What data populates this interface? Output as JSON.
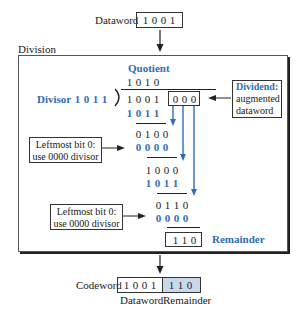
{
  "top": {
    "dataword_label": "Dataword",
    "dataword_bits": [
      "1",
      "0",
      "0",
      "1"
    ]
  },
  "division": {
    "section_label": "Division",
    "quotient_label": "Quotient",
    "quotient_bits": [
      "1",
      "0",
      "1",
      "0"
    ],
    "divisor_label": "Divisor",
    "divisor_bits": [
      "1",
      "0",
      "1",
      "1"
    ],
    "dividend_bits": [
      "1",
      "0",
      "0",
      "1"
    ],
    "augment_bits": [
      "0",
      "0",
      "0"
    ],
    "dividend_note": {
      "title": "Dividend:",
      "line1": "augmented",
      "line2": "dataword"
    },
    "steps": [
      {
        "row": [
          "1",
          "0",
          "1",
          "1"
        ],
        "color": "blue"
      },
      {
        "row": [
          "0",
          "1",
          "0",
          "0"
        ],
        "color": "black"
      },
      {
        "row": [
          "0",
          "0",
          "0",
          "0"
        ],
        "color": "blue"
      },
      {
        "row": [
          "1",
          "0",
          "0",
          "0"
        ],
        "color": "black"
      },
      {
        "row": [
          "1",
          "0",
          "1",
          "1"
        ],
        "color": "blue"
      },
      {
        "row": [
          "0",
          "1",
          "1",
          "0"
        ],
        "color": "black"
      },
      {
        "row": [
          "0",
          "0",
          "0",
          "0"
        ],
        "color": "blue"
      }
    ],
    "note1": {
      "line1": "Leftmost bit 0:",
      "line2": "use 0000 divisor"
    },
    "note2": {
      "line1": "Leftmost bit 0:",
      "line2": "use 0000 divisor"
    },
    "remainder_bits": [
      "1",
      "1",
      "0"
    ],
    "remainder_label": "Remainder"
  },
  "bottom": {
    "codeword_label": "Codeword",
    "codeword_data_bits": [
      "1",
      "0",
      "0",
      "1"
    ],
    "codeword_remainder_bits": [
      "1",
      "1",
      "0"
    ],
    "dataword_caption": "Dataword",
    "remainder_caption": "Remainder"
  },
  "colors": {
    "accent_blue": "#2f6db5",
    "remainder_shade": "#c8d9ea"
  }
}
